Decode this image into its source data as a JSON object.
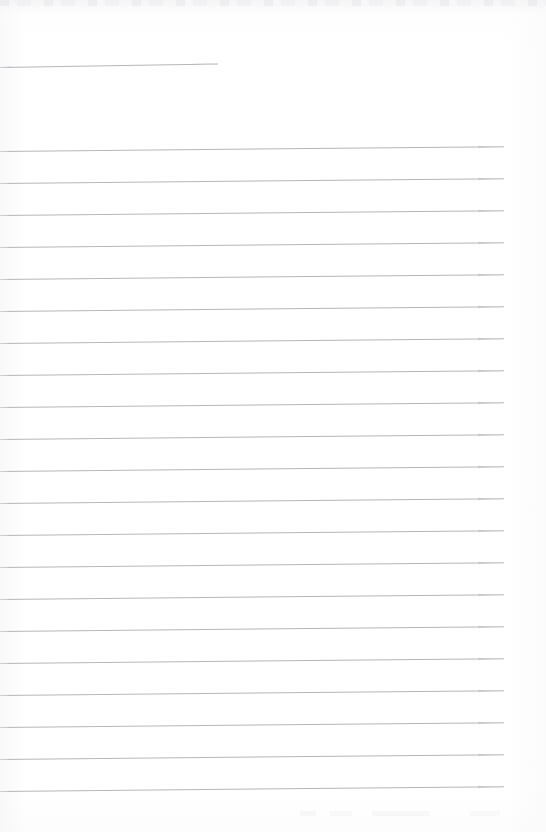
{
  "document": {
    "kind": "scanned-blank-ruled-page",
    "page_width": 546,
    "page_height": 832,
    "background_color": "#ffffff",
    "rule_color": "#b6b6bc",
    "text_content": "",
    "notes_visible": "none"
  },
  "ruling": {
    "line_spacing_px": 32,
    "line_thickness_px": 1,
    "skew_degrees": -0.55,
    "left_start_x": 0,
    "right_end_x": 504,
    "first_full_line_y": 151,
    "last_full_line_y": 791,
    "full_line_count": 21
  },
  "header_rule": {
    "y": 67,
    "x_start": 0,
    "x_end": 218,
    "length_px": 218,
    "skew_degrees": -0.9
  },
  "rules": [
    {
      "y": 67,
      "x": 0,
      "width": 218,
      "skew": -0.9,
      "kind": "short"
    },
    {
      "y": 151,
      "x": 0,
      "width": 504,
      "skew": -0.55,
      "kind": "full"
    },
    {
      "y": 183,
      "x": 0,
      "width": 504,
      "skew": -0.55,
      "kind": "full"
    },
    {
      "y": 215,
      "x": 0,
      "width": 504,
      "skew": -0.55,
      "kind": "full"
    },
    {
      "y": 247,
      "x": 0,
      "width": 504,
      "skew": -0.55,
      "kind": "full"
    },
    {
      "y": 279,
      "x": 0,
      "width": 504,
      "skew": -0.55,
      "kind": "full"
    },
    {
      "y": 311,
      "x": 0,
      "width": 504,
      "skew": -0.55,
      "kind": "full"
    },
    {
      "y": 343,
      "x": 0,
      "width": 504,
      "skew": -0.55,
      "kind": "full"
    },
    {
      "y": 375,
      "x": 0,
      "width": 504,
      "skew": -0.55,
      "kind": "full"
    },
    {
      "y": 407,
      "x": 0,
      "width": 504,
      "skew": -0.55,
      "kind": "full"
    },
    {
      "y": 439,
      "x": 0,
      "width": 504,
      "skew": -0.55,
      "kind": "full"
    },
    {
      "y": 471,
      "x": 0,
      "width": 504,
      "skew": -0.55,
      "kind": "full"
    },
    {
      "y": 503,
      "x": 0,
      "width": 504,
      "skew": -0.55,
      "kind": "full"
    },
    {
      "y": 535,
      "x": 0,
      "width": 504,
      "skew": -0.55,
      "kind": "full"
    },
    {
      "y": 567,
      "x": 0,
      "width": 504,
      "skew": -0.55,
      "kind": "full"
    },
    {
      "y": 599,
      "x": 0,
      "width": 504,
      "skew": -0.55,
      "kind": "full"
    },
    {
      "y": 631,
      "x": 0,
      "width": 504,
      "skew": -0.55,
      "kind": "full"
    },
    {
      "y": 663,
      "x": 0,
      "width": 504,
      "skew": -0.55,
      "kind": "full"
    },
    {
      "y": 695,
      "x": 0,
      "width": 504,
      "skew": -0.55,
      "kind": "full"
    },
    {
      "y": 727,
      "x": 0,
      "width": 504,
      "skew": -0.55,
      "kind": "full"
    },
    {
      "y": 759,
      "x": 0,
      "width": 504,
      "skew": -0.55,
      "kind": "full"
    },
    {
      "y": 791,
      "x": 0,
      "width": 504,
      "skew": -0.55,
      "kind": "full"
    }
  ]
}
